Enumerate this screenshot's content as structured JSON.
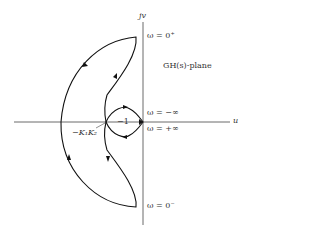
{
  "diagram": {
    "plane_label": "GH(s)-plane",
    "axis_labels": {
      "vertical": "jv",
      "horizontal": "u"
    },
    "annotations": {
      "omega_0_plus": "ω = 0⁺",
      "omega_0_minus": "ω = 0⁻",
      "omega_neg_inf": "ω = −∞",
      "omega_pos_inf": "ω = +∞",
      "crossing_point": "−K₁K₂",
      "minus_one": "−1"
    },
    "colors": {
      "stroke": "#111111",
      "axis": "#444444",
      "text": "#333333"
    }
  }
}
